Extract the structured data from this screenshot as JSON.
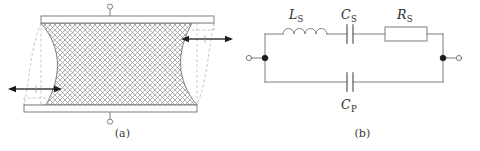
{
  "figure": {
    "background_color": "#ffffff",
    "line_color": "#555555",
    "text_color": "#2b2b2b",
    "hatch_color": "#9a9a9a",
    "dashed_color": "#b0b0b0"
  },
  "panel_a": {
    "caption": "(a)",
    "name": "piezoelectric-crystal-deformation",
    "terminals": [
      {
        "name": "top-terminal",
        "position": "top"
      },
      {
        "name": "bottom-terminal",
        "position": "bottom"
      }
    ],
    "electrodes": [
      {
        "name": "top-electrode"
      },
      {
        "name": "bottom-electrode"
      }
    ],
    "body": {
      "name": "crystal-body",
      "fill_pattern": "cross-hatch",
      "deformation": "shear"
    },
    "arrows": [
      {
        "name": "left-expansion-arrow-pair",
        "direction": "horizontal-double"
      },
      {
        "name": "right-expansion-arrow-pair",
        "direction": "horizontal-double"
      }
    ],
    "dashed_outline": {
      "name": "undeformed-outline",
      "style": "dashed"
    }
  },
  "panel_b": {
    "caption": "(b)",
    "name": "equivalent-circuit",
    "components": [
      {
        "id": "inductor-series",
        "type": "inductor",
        "label_base": "L",
        "label_sub": "S",
        "label_full": "LS",
        "branch": "series"
      },
      {
        "id": "capacitor-series",
        "type": "capacitor",
        "label_base": "C",
        "label_sub": "S",
        "label_full": "CS",
        "branch": "series"
      },
      {
        "id": "resistor-series",
        "type": "resistor",
        "label_base": "R",
        "label_sub": "S",
        "label_full": "RS",
        "branch": "series"
      },
      {
        "id": "capacitor-parallel",
        "type": "capacitor",
        "label_base": "C",
        "label_sub": "P",
        "label_full": "CP",
        "branch": "parallel"
      }
    ],
    "terminals": [
      {
        "name": "left-terminal",
        "position": "left"
      },
      {
        "name": "right-terminal",
        "position": "right"
      }
    ],
    "nodes": [
      {
        "name": "left-junction-node"
      },
      {
        "name": "right-junction-node"
      }
    ]
  }
}
